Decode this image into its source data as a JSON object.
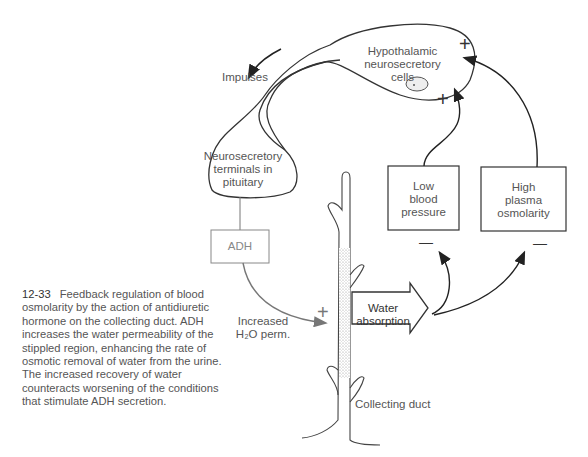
{
  "figure": {
    "number": "12-33",
    "caption": "Feedback regulation of blood osmolarity by the action of antidiuretic hormone on the collecting duct. ADH increases the water permeability of the stippled region, enhancing the rate of osmotic removal of water from the urine. The increased recovery of water counteracts worsening of the conditions that stimulate ADH secretion."
  },
  "labels": {
    "impulses": "Impulses",
    "hypothalamic": [
      "Hypothalamic",
      "neurosecretory",
      "cells"
    ],
    "terminals": [
      "Neurosecretory",
      "terminals in",
      "pituitary"
    ],
    "adh": "ADH",
    "increased_perm": [
      "Increased",
      "H₂O perm."
    ],
    "water_absorption": [
      "Water",
      "absorption"
    ],
    "low_bp": [
      "Low",
      "blood",
      "pressure"
    ],
    "high_osm": [
      "High",
      "plasma",
      "osmolarity"
    ],
    "collecting_duct": "Collecting duct"
  },
  "signs": {
    "plus": "+",
    "minus": "—"
  },
  "colors": {
    "line": "#333333",
    "adh_box": "#888888",
    "stipple": "#bbbbbb"
  }
}
